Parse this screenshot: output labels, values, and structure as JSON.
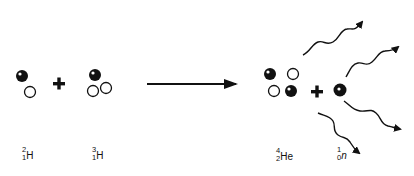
{
  "diagram": {
    "reactants": [
      {
        "name": "deuterium",
        "mass_number": "2",
        "atomic_number": "1",
        "symbol": "H",
        "protons": 1,
        "neutrons": 1
      },
      {
        "name": "tritium",
        "mass_number": "3",
        "atomic_number": "1",
        "symbol": "H",
        "protons": 1,
        "neutrons": 2
      }
    ],
    "products": [
      {
        "name": "helium-4",
        "mass_number": "4",
        "atomic_number": "2",
        "symbol": "He",
        "protons": 2,
        "neutrons": 2
      },
      {
        "name": "neutron",
        "mass_number": "1",
        "atomic_number": "0",
        "symbol": "n",
        "protons": 0,
        "neutrons": 1
      }
    ],
    "operators": {
      "plus": "+",
      "arrow": "→"
    },
    "energy_rays": 4,
    "legend": {
      "filled_circle": "proton",
      "open_circle": "neutron"
    },
    "colors": {
      "ink": "#111111",
      "background": "#ffffff"
    }
  }
}
